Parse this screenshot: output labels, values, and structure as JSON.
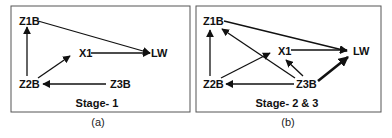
{
  "panels": [
    {
      "id": "a",
      "stage_label": "Stage- 1",
      "caption": "(a)",
      "nodes": [
        {
          "id": "Z1B",
          "label": "Z1B"
        },
        {
          "id": "X1",
          "label": "X1"
        },
        {
          "id": "LW",
          "label": "LW"
        },
        {
          "id": "Z2B",
          "label": "Z2B"
        },
        {
          "id": "Z3B",
          "label": "Z3B"
        }
      ],
      "edges": [
        {
          "from": "Z1B",
          "to": "LW",
          "weight": "normal"
        },
        {
          "from": "X1",
          "to": "LW",
          "weight": "normal"
        },
        {
          "from": "Z2B",
          "to": "Z1B",
          "weight": "normal"
        },
        {
          "from": "Z2B",
          "to": "X1",
          "weight": "normal"
        },
        {
          "from": "Z3B",
          "to": "Z2B",
          "weight": "normal"
        }
      ]
    },
    {
      "id": "b",
      "stage_label": "Stage- 2 & 3",
      "caption": "(b)",
      "nodes": [
        {
          "id": "Z1B",
          "label": "Z1B"
        },
        {
          "id": "X1",
          "label": "X1"
        },
        {
          "id": "LW",
          "label": "LW"
        },
        {
          "id": "Z2B",
          "label": "Z2B"
        },
        {
          "id": "Z3B",
          "label": "Z3B"
        }
      ],
      "edges": [
        {
          "from": "Z1B",
          "to": "LW",
          "weight": "normal"
        },
        {
          "from": "X1",
          "to": "LW",
          "weight": "normal"
        },
        {
          "from": "Z2B",
          "to": "Z1B",
          "weight": "normal"
        },
        {
          "from": "Z2B",
          "to": "X1",
          "weight": "normal"
        },
        {
          "from": "Z3B",
          "to": "Z2B",
          "weight": "normal"
        },
        {
          "from": "Z3B",
          "to": "Z1B",
          "weight": "normal"
        },
        {
          "from": "Z3B",
          "to": "X1",
          "weight": "normal"
        },
        {
          "from": "Z3B",
          "to": "LW",
          "weight": "bold"
        }
      ]
    }
  ]
}
